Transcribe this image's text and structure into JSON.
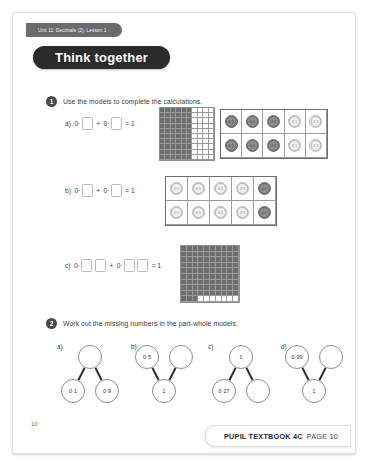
{
  "page": {
    "unit_banner": "Unit 11: Decimals (2), Lesson 1",
    "title": "Think together",
    "page_number": "10"
  },
  "questions": [
    {
      "number": "1",
      "text": "Use the models to complete the calculations.",
      "parts": [
        {
          "label": "a)",
          "equation": {
            "prefix_left": "0·",
            "boxes_left": 1,
            "operator": "+",
            "prefix_right": "0·",
            "boxes_right": 1,
            "equals": "= 1"
          },
          "hundred_square": {
            "shaded": 60,
            "columns_shaded": 6
          },
          "counters": {
            "rows": 2,
            "cols": 5,
            "label": "0·1",
            "dark_per_row": 3,
            "light_per_row": 2
          }
        },
        {
          "label": "b)",
          "equation": {
            "prefix_left": "0·",
            "boxes_left": 1,
            "operator": "+",
            "prefix_right": "0·",
            "boxes_right": 1,
            "equals": "= 1"
          },
          "counters": {
            "rows": 2,
            "cols": 5,
            "label": "0·1",
            "light_per_row": 4,
            "dark_per_row": 1
          }
        },
        {
          "label": "c)",
          "equation": {
            "prefix_left": "0·",
            "boxes_left": 2,
            "operator": "+",
            "prefix_right": "0·",
            "boxes_right": 2,
            "equals": "= 1"
          },
          "hundred_square": {
            "shaded": 93,
            "unshaded": 7
          }
        }
      ]
    },
    {
      "number": "2",
      "text": "Work out the missing numbers in the part-whole models.",
      "models": [
        {
          "label": "a)",
          "orientation": "whole-top",
          "whole": "",
          "parts": [
            "0·1",
            "0·9"
          ]
        },
        {
          "label": "b)",
          "orientation": "whole-bottom",
          "whole": "1",
          "parts": [
            "0·5",
            ""
          ]
        },
        {
          "label": "c)",
          "orientation": "whole-top",
          "whole": "1",
          "parts": [
            "0·27",
            ""
          ]
        },
        {
          "label": "d)",
          "orientation": "whole-bottom",
          "whole": "1",
          "parts": [
            "0·99",
            ""
          ]
        }
      ]
    }
  ],
  "footer": {
    "book": "PUPIL TEXTBOOK 4C",
    "page": "PAGE 10"
  }
}
